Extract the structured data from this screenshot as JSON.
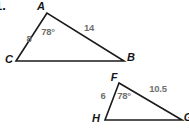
{
  "problem_number": "1.",
  "colors": {
    "line": "#1b1b1b",
    "vertex_label": "#161616",
    "measure_label": "#6f6f6f",
    "background": "#ffffff"
  },
  "triangle_abc": {
    "points": "47,13 16,61 124,61",
    "vertex_a": "A",
    "vertex_b": "B",
    "vertex_c": "C",
    "angle_a": "78°",
    "side_ac": "8",
    "side_ab": "14"
  },
  "triangle_fgh": {
    "points": "119,83 105,120 182,120",
    "vertex_f": "F",
    "vertex_g": "G",
    "vertex_h": "H",
    "angle_f": "78°",
    "side_fh": "6",
    "side_fg": "10.5"
  }
}
